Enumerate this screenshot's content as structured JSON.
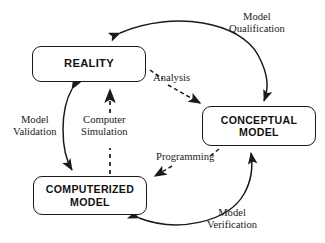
{
  "figure": {
    "type": "flow-diagram",
    "background_color": "#ffffff",
    "stroke_color": "#1a1a1a"
  },
  "nodes": [
    {
      "id": "reality",
      "label": "REALITY",
      "x": 32,
      "y": 46,
      "width": 114,
      "height": 36
    },
    {
      "id": "conceptual-model",
      "label": "CONCEPTUAL\nMODEL",
      "x": 202,
      "y": 106,
      "width": 114,
      "height": 40
    },
    {
      "id": "computerized-model",
      "label": "COMPUTERIZED\nMODEL",
      "x": 33,
      "y": 176,
      "width": 114,
      "height": 39
    }
  ],
  "edges": [
    {
      "id": "model-qualification",
      "label": "Model\nQualification",
      "style": "solid",
      "arrows": "double",
      "from": "reality",
      "to": "conceptual-model",
      "label_x": 228,
      "label_y": 11
    },
    {
      "id": "analysis",
      "label": "Analysis",
      "style": "dashed",
      "arrows": "single",
      "from": "reality",
      "to": "conceptual-model",
      "label_x": 152,
      "label_y": 72
    },
    {
      "id": "model-validation",
      "label": "Model\nValidation",
      "style": "solid",
      "arrows": "double",
      "from": "computerized-model",
      "to": "reality",
      "label_x": 12,
      "label_y": 114
    },
    {
      "id": "computer-simulation",
      "label": "Computer\nSimulation",
      "style": "dashed",
      "arrows": "single",
      "from": "computerized-model",
      "to": "reality",
      "label_x": 80,
      "label_y": 114
    },
    {
      "id": "programming",
      "label": "Programming",
      "style": "dashed",
      "arrows": "single",
      "from": "conceptual-model",
      "to": "computerized-model",
      "label_x": 155,
      "label_y": 151
    },
    {
      "id": "model-verification",
      "label": "Model\nVerification",
      "style": "solid",
      "arrows": "double",
      "from": "computerized-model",
      "to": "conceptual-model",
      "label_x": 206,
      "label_y": 207
    }
  ]
}
